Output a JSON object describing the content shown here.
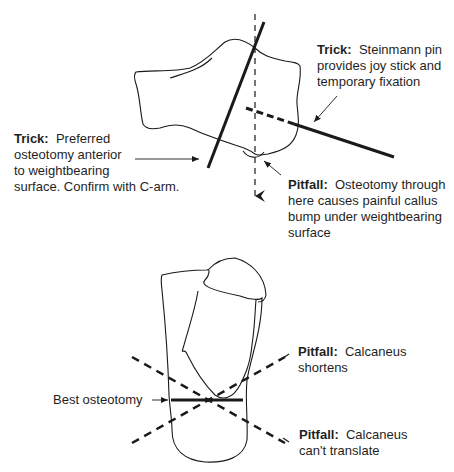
{
  "top_figure": {
    "trick_pin": {
      "heading": "Trick:",
      "lines": [
        "Steinmann pin",
        "provides joy stick and",
        "temporary fixation"
      ]
    },
    "trick_osteotomy": {
      "heading": "Trick:",
      "lines": [
        "Preferred",
        "osteotomy anterior",
        "to weightbearing",
        "surface. Confirm with C-arm."
      ]
    },
    "pitfall_callus": {
      "heading": "Pitfall:",
      "lines": [
        "Osteotomy through",
        "here causes painful callus",
        "bump under weightbearing",
        "surface"
      ]
    }
  },
  "bottom_figure": {
    "best_label": "Best osteotomy",
    "pitfall_shortens": {
      "heading": "Pitfall:",
      "lines": [
        "Calcaneus",
        "shortens"
      ]
    },
    "pitfall_translate": {
      "heading": "Pitfall:",
      "lines": [
        "Calcaneus",
        "can't translate"
      ]
    }
  },
  "colors": {
    "ink": "#1a1a1a",
    "background": "#ffffff"
  }
}
